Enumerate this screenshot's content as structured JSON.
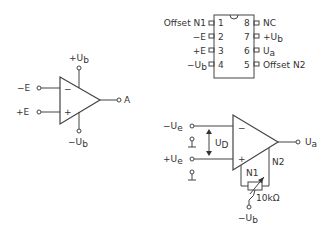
{
  "symbol": {
    "inverting_input": "−E",
    "noninverting_input": "+E",
    "supply_positive": {
      "main": "+U",
      "sub": "b"
    },
    "supply_negative": {
      "main": "−U",
      "sub": "b"
    },
    "output": "A",
    "minus_sign": "−",
    "plus_sign": "+"
  },
  "pinout": {
    "left_pins": [
      {
        "number": "1",
        "label": "Offset N1"
      },
      {
        "number": "2",
        "label": "−E"
      },
      {
        "number": "3",
        "label": "+E"
      },
      {
        "number": "4",
        "label": "−U",
        "sub": "b"
      }
    ],
    "right_pins": [
      {
        "number": "8",
        "label": "NC"
      },
      {
        "number": "7",
        "label": "+U",
        "sub": "b"
      },
      {
        "number": "6",
        "label": "U",
        "sub": "a"
      },
      {
        "number": "5",
        "label": "Offset N2"
      }
    ]
  },
  "circuit": {
    "inverting_input": {
      "main": "−U",
      "sub": "e"
    },
    "noninverting_input": {
      "main": "+U",
      "sub": "e"
    },
    "differential_voltage": {
      "main": "U",
      "sub": "D"
    },
    "output": {
      "main": "U",
      "sub": "a"
    },
    "offset_n1": "N1",
    "offset_n2": "N2",
    "potentiometer": "10kΩ",
    "supply_negative": {
      "main": "−U",
      "sub": "b"
    },
    "minus_sign": "−",
    "plus_sign": "+"
  }
}
